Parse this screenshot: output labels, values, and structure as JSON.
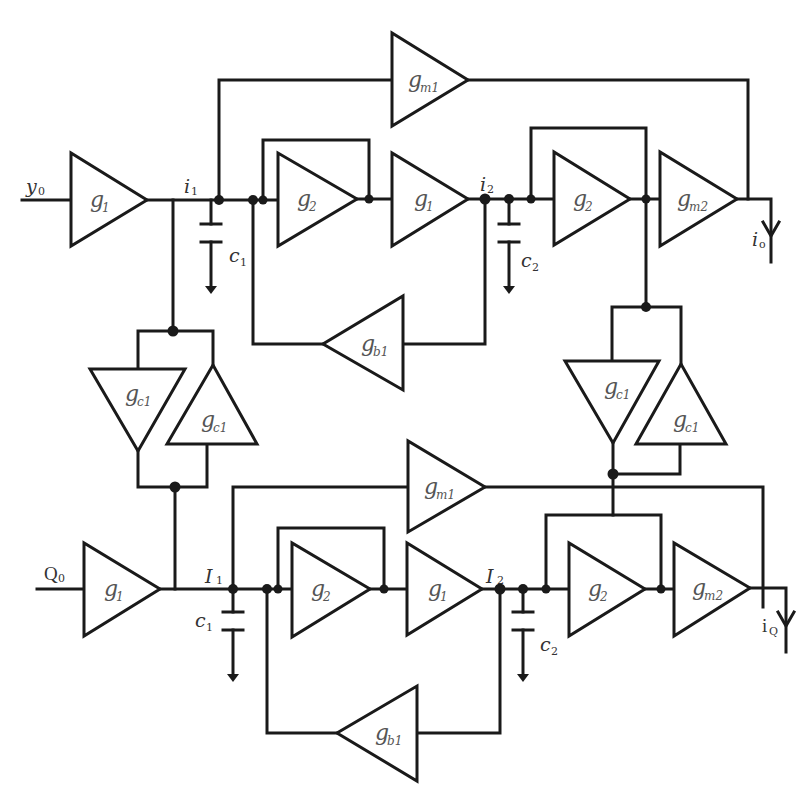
{
  "diagram": {
    "type": "circuit-schematic",
    "colors": {
      "wire": "#1a1a1a",
      "label": "#555555",
      "background": "#ffffff"
    },
    "top_path": {
      "input": {
        "name": "y",
        "sub": "0"
      },
      "output": {
        "name": "i",
        "sub": "o"
      },
      "nodes": [
        {
          "name": "i",
          "sub": "1"
        },
        {
          "name": "i",
          "sub": "2"
        }
      ],
      "capacitors": [
        {
          "name": "c",
          "sub": "1"
        },
        {
          "name": "c",
          "sub": "2"
        }
      ],
      "blocks": [
        {
          "id": "g1_in",
          "name": "g",
          "sub": "1"
        },
        {
          "id": "g2_a",
          "name": "g",
          "sub": "2"
        },
        {
          "id": "g1_mid",
          "name": "g",
          "sub": "1"
        },
        {
          "id": "g2_b",
          "name": "g",
          "sub": "2"
        },
        {
          "id": "gm2",
          "name": "g",
          "sub": "m2"
        },
        {
          "id": "gm1",
          "name": "g",
          "sub": "m1"
        },
        {
          "id": "gb1",
          "name": "g",
          "sub": "b1"
        }
      ]
    },
    "bottom_path": {
      "input": {
        "name": "Q",
        "sub": "0"
      },
      "output": {
        "name": "i",
        "sub": "Q"
      },
      "nodes": [
        {
          "name": "I",
          "sub": "1"
        },
        {
          "name": "I",
          "sub": "2"
        }
      ],
      "capacitors": [
        {
          "name": "c",
          "sub": "1"
        },
        {
          "name": "c",
          "sub": "2"
        }
      ],
      "blocks": [
        {
          "id": "g1_in",
          "name": "g",
          "sub": "1"
        },
        {
          "id": "g2_a",
          "name": "g",
          "sub": "2"
        },
        {
          "id": "g1_mid",
          "name": "g",
          "sub": "1"
        },
        {
          "id": "g2_b",
          "name": "g",
          "sub": "2"
        },
        {
          "id": "gm2",
          "name": "g",
          "sub": "m2"
        },
        {
          "id": "gm1",
          "name": "g",
          "sub": "m1"
        },
        {
          "id": "gb1",
          "name": "g",
          "sub": "b1"
        }
      ]
    },
    "coupling_left": [
      {
        "name": "g",
        "sub": "c1"
      },
      {
        "name": "g",
        "sub": "c1"
      }
    ],
    "coupling_right": [
      {
        "name": "g",
        "sub": "c1"
      },
      {
        "name": "g",
        "sub": "c1"
      }
    ]
  }
}
